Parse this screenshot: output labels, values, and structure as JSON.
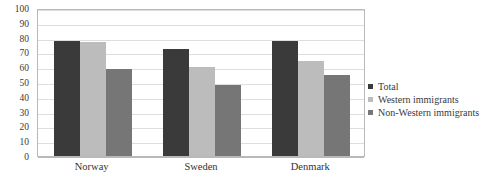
{
  "chart_data": {
    "type": "bar",
    "title": "",
    "xlabel": "",
    "ylabel": "",
    "ylim": [
      0,
      100
    ],
    "ytick_step": 10,
    "yticks": [
      "100",
      "90",
      "80",
      "70",
      "60",
      "50",
      "40",
      "30",
      "20",
      "10",
      "0"
    ],
    "grid": true,
    "legend_position": "right",
    "categories": [
      "Norway",
      "Sweden",
      "Denmark"
    ],
    "series": [
      {
        "name": "Total",
        "color": "#3a3a3a",
        "values": [
          78,
          72,
          78
        ]
      },
      {
        "name": "Western immigrants",
        "color": "#bcbcbc",
        "values": [
          77,
          60,
          64
        ]
      },
      {
        "name": "Non-Western immigrants",
        "color": "#767676",
        "values": [
          59,
          48,
          55
        ]
      }
    ]
  },
  "legend": {
    "items": [
      {
        "label": "Total",
        "color": "#3a3a3a"
      },
      {
        "label": "Western immigrants",
        "color": "#bcbcbc"
      },
      {
        "label": "Non-Western immigrants",
        "color": "#767676"
      }
    ]
  },
  "axis": {
    "y_max": 100,
    "y_min": 0
  },
  "colors": {
    "plot_border": "#b9b9b9",
    "gridline": "#dedede",
    "background": "#ffffff",
    "text": "#333333"
  }
}
